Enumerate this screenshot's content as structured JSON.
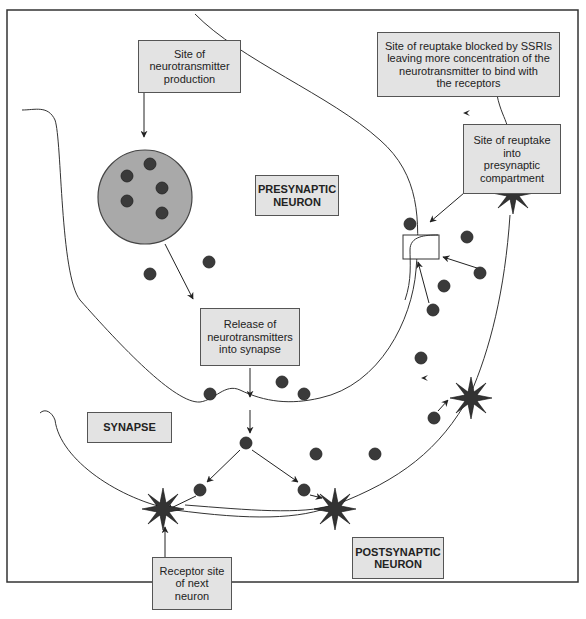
{
  "diagram": {
    "colors": {
      "box_fill": "#e3e3e3",
      "vesicle_fill": "#a9a9a9",
      "molecule_fill": "#3a3a3a",
      "line": "#333333"
    },
    "labels": {
      "production": "Site of\nneurotransmitter\nproduction",
      "ssri": "Site of reuptake blocked by SSRIs\nleaving more concentration of the\nneurotransmitter to bind with\nthe receptors",
      "reuptake_site": "Site of reuptake\ninto\npresynaptic\ncompartment",
      "presynaptic": "PRESYNAPTIC\nNEURON",
      "release": "Release of\nneurotransmitters\ninto synapse",
      "synapse": "SYNAPSE",
      "receptor": "Receptor site\nof next\nneuron",
      "postsynaptic": "POSTSYNAPTIC\nNEURON"
    },
    "elements": {
      "vesicle": "neurotransmitter-vesicle",
      "molecules": "neurotransmitter-molecules",
      "receptors": "receptor-stars",
      "reuptake_pump": "reuptake-transporter-box"
    }
  }
}
